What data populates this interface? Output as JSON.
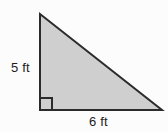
{
  "figure": {
    "kind": "right-triangle-diagram",
    "background_color": "#fcfcfc",
    "fill_color": "#cfcfcf",
    "stroke_color": "#2b2b2b",
    "stroke_width": 2,
    "label_color": "#1c1c1c",
    "vertices": {
      "apex": {
        "x": 40,
        "y": 14
      },
      "right_angle": {
        "x": 40,
        "y": 110
      },
      "base_right": {
        "x": 162,
        "y": 110
      }
    },
    "right_angle_marker": {
      "x": 40,
      "y": 98,
      "size": 12,
      "present": true
    },
    "labels": {
      "vertical_leg": "5 ft",
      "horizontal_leg": "6 ft"
    }
  },
  "chart_data": {
    "type": "diagram",
    "title": "",
    "shape": "right triangle",
    "measurements": [
      {
        "side": "vertical leg (height)",
        "value": 5,
        "unit": "ft",
        "label": "5 ft"
      },
      {
        "side": "horizontal leg (base)",
        "value": 6,
        "unit": "ft",
        "label": "6 ft"
      }
    ],
    "annotations": [
      "right angle at bottom-left vertex"
    ]
  }
}
